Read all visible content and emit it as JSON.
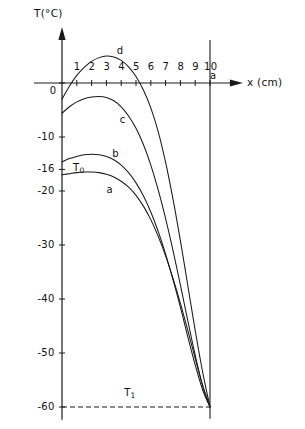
{
  "chart_data": {
    "type": "line",
    "title": "",
    "subtitle": "",
    "xlabel": "x (cm)",
    "ylabel": "T(°C)",
    "xlim": [
      0,
      10.6
    ],
    "ylim": [
      -62,
      9
    ],
    "grid": false,
    "legend_position": "inline-curve-labels",
    "x_ticks": [
      1,
      2,
      3,
      4,
      5,
      6,
      7,
      8,
      9,
      10
    ],
    "x_tick_labels": [
      "1",
      "2",
      "3",
      "4",
      "5",
      "6",
      "7",
      "8",
      "9",
      "10"
    ],
    "y_ticks": [
      0,
      -10,
      -16,
      -20,
      -30,
      -40,
      -50,
      -60
    ],
    "y_tick_labels": [
      "0",
      "-10",
      "-16",
      "-20",
      "-30",
      "-40",
      "-50",
      "-60"
    ],
    "annotations": [
      {
        "name": "T0",
        "text": "T",
        "sub": "0",
        "x": 0.75,
        "y": -14.8
      },
      {
        "name": "T1",
        "text": "T",
        "sub": "1",
        "x": 4.2,
        "y": -56.5
      },
      {
        "name": "wall",
        "text": "a",
        "x": 10.0,
        "y": 2.2
      }
    ],
    "reference_lines": [
      {
        "name": "wall-boundary",
        "orientation": "vertical",
        "value": 10,
        "style": "solid",
        "label": "a"
      },
      {
        "name": "T1-level",
        "orientation": "horizontal",
        "value": -60,
        "style": "dashed",
        "label": "T1"
      }
    ],
    "series": [
      {
        "name": "a",
        "label": "a",
        "label_x": 3.0,
        "label_y": -18.8,
        "x": [
          0,
          0.5,
          1,
          1.5,
          2,
          2.5,
          3,
          3.5,
          4,
          4.5,
          5,
          5.5,
          6,
          6.5,
          7,
          7.5,
          8,
          8.5,
          9,
          9.5,
          10
        ],
        "y": [
          -17.0,
          -16.8,
          -16.6,
          -16.5,
          -16.5,
          -16.6,
          -16.9,
          -17.4,
          -18.2,
          -19.3,
          -20.8,
          -22.8,
          -25.3,
          -28.4,
          -32.0,
          -36.2,
          -40.8,
          -45.8,
          -51.0,
          -56.0,
          -60.0
        ]
      },
      {
        "name": "b",
        "label": "b",
        "label_x": 3.4,
        "label_y": -12.2,
        "x": [
          0,
          0.5,
          1,
          1.5,
          2,
          2.5,
          3,
          3.5,
          4,
          4.5,
          5,
          5.5,
          6,
          6.5,
          7,
          7.5,
          8,
          8.5,
          9,
          9.5,
          10
        ],
        "y": [
          -14.6,
          -14.0,
          -13.6,
          -13.3,
          -13.2,
          -13.3,
          -13.6,
          -14.2,
          -15.2,
          -16.6,
          -18.5,
          -20.9,
          -23.9,
          -27.5,
          -31.7,
          -36.4,
          -41.5,
          -47.0,
          -52.2,
          -56.8,
          -60.0
        ]
      },
      {
        "name": "c",
        "label": "c",
        "label_x": 3.9,
        "label_y": -6.0,
        "x": [
          0,
          0.5,
          1,
          1.5,
          2,
          2.5,
          3,
          3.5,
          4,
          4.5,
          5,
          5.5,
          6,
          6.5,
          7,
          7.5,
          8,
          8.5,
          9,
          9.5,
          10
        ],
        "y": [
          -5.6,
          -4.4,
          -3.5,
          -2.9,
          -2.6,
          -2.5,
          -2.7,
          -3.3,
          -4.4,
          -6.1,
          -8.4,
          -11.4,
          -15.2,
          -19.8,
          -25.1,
          -31.0,
          -37.4,
          -44.0,
          -50.4,
          -56.0,
          -60.0
        ]
      },
      {
        "name": "d",
        "label": "d",
        "label_x": 3.7,
        "label_y": 6.8,
        "x": [
          0,
          0.5,
          1,
          1.5,
          2,
          2.5,
          3,
          3.5,
          4,
          4.5,
          5,
          5.5,
          6,
          6.5,
          7,
          7.5,
          8,
          8.5,
          9,
          9.5,
          10
        ],
        "y": [
          -3.0,
          -0.6,
          1.4,
          2.9,
          4.0,
          4.7,
          5.0,
          4.8,
          4.2,
          3.0,
          1.2,
          -1.3,
          -4.6,
          -9.0,
          -14.7,
          -21.5,
          -29.2,
          -37.5,
          -45.8,
          -53.5,
          -60.0
        ]
      }
    ]
  },
  "axes": {
    "x_axis_name": "x-axis",
    "y_axis_name": "y-axis"
  }
}
